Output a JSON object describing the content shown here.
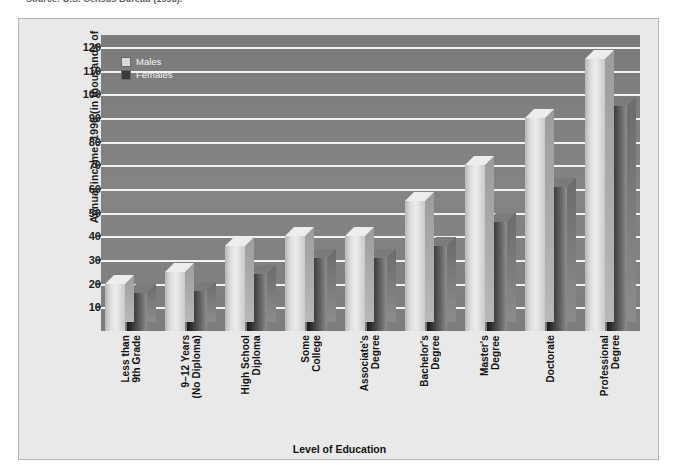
{
  "source_note": "Source: U.S. Census Bureau (1998).",
  "axis_title": {
    "x": "Level of Education",
    "y": "Annual income, 1996 (in thousands of dollars)"
  },
  "legend": {
    "position": "top-left-inside",
    "entries": [
      {
        "label": "Males",
        "color": "#dedede",
        "swatch": "males-swatch"
      },
      {
        "label": "Females",
        "color": "#2e2e2e",
        "swatch": "females-swatch"
      }
    ]
  },
  "colors": {
    "plot_background": "#7f7f7f",
    "panel_background": "#e9e9e9",
    "gridline": "#f2f2f2",
    "males_bar": "#dedede",
    "females_bar": "#2e2e2e",
    "text": "#111111"
  },
  "chart_data": {
    "type": "bar",
    "title": "",
    "subtitle": "",
    "xlabel": "Level of Education",
    "ylabel": "Annual income, 1996 (in thousands of dollars)",
    "ylim": [
      0,
      125
    ],
    "yticks": [
      10,
      20,
      30,
      40,
      50,
      60,
      70,
      80,
      90,
      100,
      110,
      120
    ],
    "ytick_labels": [
      "10",
      "20",
      "30",
      "40",
      "50",
      "60",
      "70",
      "80",
      "90",
      "100",
      "110",
      "120"
    ],
    "grid": true,
    "legend_position": "upper left",
    "units": "thousands of dollars",
    "categories": [
      "Less than\n9th Grade",
      "9–12 Years\n(No Diploma)",
      "High School\nDiploma",
      "Some\nCollege",
      "Associate's\nDegree",
      "Bachelor's\nDegree",
      "Master's\nDegree",
      "Doctorate",
      "Professional\nDegree"
    ],
    "series": [
      {
        "name": "Males",
        "color": "#dedede",
        "values": [
          20,
          25,
          36,
          40,
          40,
          55,
          70,
          90,
          115
        ]
      },
      {
        "name": "Females",
        "color": "#2e2e2e",
        "values": [
          16,
          17,
          24,
          31,
          31,
          36,
          46,
          61,
          95
        ]
      }
    ]
  }
}
